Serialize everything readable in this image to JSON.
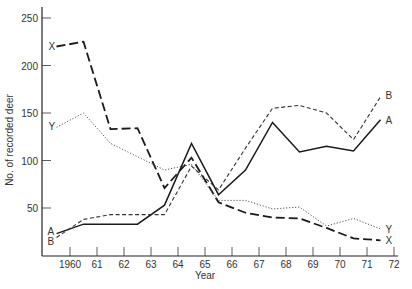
{
  "chart_data": {
    "type": "line",
    "title": "",
    "xlabel": "Year",
    "ylabel": "No. of recorded deer",
    "ylim": [
      0,
      260
    ],
    "xlim": [
      1959,
      1972
    ],
    "grid": false,
    "legend": "inline labels at line ends",
    "y_ticks": [
      50,
      100,
      150,
      200,
      250
    ],
    "x_ticks": [
      1960,
      1961,
      1962,
      1963,
      1964,
      1965,
      1966,
      1967,
      1968,
      1969,
      1970,
      1971,
      1972
    ],
    "x_tick_labels": [
      "1960",
      "61",
      "62",
      "63",
      "64",
      "65",
      "66",
      "67",
      "68",
      "69",
      "70",
      "71",
      "72"
    ],
    "x": [
      1959.5,
      1960.5,
      1961.5,
      1962.5,
      1963.5,
      1964.5,
      1965.5,
      1966.5,
      1967.5,
      1968.5,
      1969.5,
      1970.5,
      1971.5
    ],
    "series": [
      {
        "name": "X",
        "style": "long-dash",
        "values": [
          220,
          225,
          133,
          134,
          71,
          103,
          56,
          45,
          40,
          39,
          29,
          18,
          16
        ]
      },
      {
        "name": "Y",
        "style": "dotted",
        "values": [
          135,
          150,
          118,
          104,
          90,
          96,
          58,
          58,
          49,
          51,
          31,
          39,
          28
        ]
      },
      {
        "name": "A",
        "style": "solid",
        "values": [
          23,
          33,
          33,
          33,
          53,
          118,
          64,
          90,
          140,
          109,
          115,
          110,
          143
        ]
      },
      {
        "name": "B",
        "style": "short-dash",
        "values": [
          19,
          38,
          43,
          43,
          43,
          94,
          69,
          113,
          155,
          158,
          150,
          122,
          167
        ]
      }
    ]
  }
}
